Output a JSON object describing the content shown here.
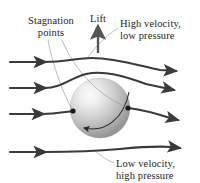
{
  "figure": {
    "title_semantic": "magnus-effect-spinning-ball-airflow-diagram",
    "background_color": "#ffffff",
    "width": 200,
    "height": 183
  },
  "labels": {
    "stagnation": {
      "line1": "Stagnation",
      "line2": "points"
    },
    "lift": "Lift",
    "high_velocity": {
      "line1": "High velocity,",
      "line2": "low pressure"
    },
    "low_velocity": {
      "line1": "Low velocity,",
      "line2": "high pressure"
    }
  },
  "colors": {
    "text": "#262626",
    "streamline": "#3a3a3a",
    "leader_line": "#9a9a9a",
    "ball_light": "#f2f2f2",
    "ball_mid": "#b8b8b8",
    "ball_dark": "#8a8a8a",
    "stagnation_dot": "#1a1a1a",
    "lift_arrow": "#555555",
    "spin_arrow": "#2b2b2b"
  },
  "diagram_elements": {
    "ball": {
      "name": "spinning-ball",
      "center_x": 100,
      "center_y": 108,
      "radius": 30,
      "shading": "radial-gradient-upper-left-highlight"
    },
    "spin_direction": "counterclockwise",
    "stagnation_points": [
      {
        "x": 74,
        "y": 112
      },
      {
        "x": 128,
        "y": 108
      }
    ],
    "lift_arrow": {
      "direction": "up",
      "x": 98,
      "from_y": 52,
      "to_y": 26
    },
    "streamlines": [
      {
        "id": 1,
        "position": "top",
        "flow_direction": "left-to-right",
        "deflection": "over-ball-upward"
      },
      {
        "id": 2,
        "position": "upper-middle",
        "flow_direction": "left-to-right",
        "deflection": "over-ball-upward"
      },
      {
        "id": 3,
        "position": "lower-middle",
        "flow_direction": "left-to-right",
        "deflection": "under-ball-downward"
      },
      {
        "id": 4,
        "position": "bottom",
        "flow_direction": "left-to-right",
        "deflection": "slight-downward"
      }
    ],
    "arrowhead_count_left": 4,
    "arrowhead_count_right": 4
  }
}
